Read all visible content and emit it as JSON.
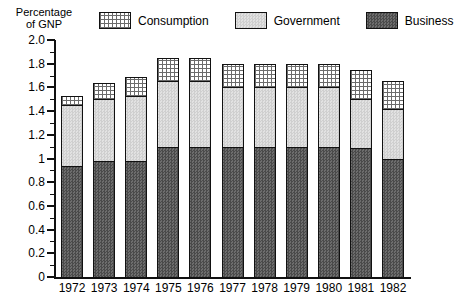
{
  "axis_title": "Percentage\nof GNP",
  "legend": [
    {
      "key": "consumption",
      "label": "Consumption",
      "pattern": "dot-grid",
      "color": "#ffffff"
    },
    {
      "key": "government",
      "label": "Government",
      "pattern": "light-checker",
      "color": "#d7d7d7"
    },
    {
      "key": "business",
      "label": "Business",
      "pattern": "dark-checker",
      "color": "#5a5a5a"
    }
  ],
  "y_tick_labels": [
    "2.0",
    "1.8",
    "1.6",
    "1.4",
    "1.2",
    "1",
    "0.8",
    "0.6",
    "0.4",
    "0.2",
    "0"
  ],
  "chart_data": {
    "type": "bar",
    "title": "",
    "subtype": "stacked",
    "xlabel": "",
    "ylabel": "Percentage of GNP",
    "ylim": [
      0,
      2.0
    ],
    "ytick_step": 0.2,
    "yminor_step": 0.1,
    "grid": false,
    "legend_position": "top",
    "categories": [
      "1972",
      "1973",
      "1974",
      "1975",
      "1976",
      "1977",
      "1978",
      "1979",
      "1980",
      "1981",
      "1982"
    ],
    "series": [
      {
        "name": "Business",
        "values": [
          0.94,
          0.98,
          0.98,
          1.1,
          1.1,
          1.1,
          1.1,
          1.1,
          1.1,
          1.09,
          1.0
        ]
      },
      {
        "name": "Government",
        "values": [
          0.51,
          0.52,
          0.55,
          0.55,
          0.55,
          0.5,
          0.5,
          0.5,
          0.5,
          0.41,
          0.42
        ]
      },
      {
        "name": "Consumption",
        "values": [
          0.08,
          0.14,
          0.16,
          0.2,
          0.2,
          0.2,
          0.2,
          0.2,
          0.2,
          0.25,
          0.23
        ]
      }
    ],
    "totals": [
      1.53,
      1.64,
      1.69,
      1.85,
      1.85,
      1.8,
      1.8,
      1.8,
      1.8,
      1.75,
      1.65
    ],
    "cumulative_tops": {
      "business": [
        0.94,
        0.98,
        0.98,
        1.1,
        1.1,
        1.1,
        1.1,
        1.1,
        1.1,
        1.09,
        1.0
      ],
      "government": [
        1.45,
        1.5,
        1.53,
        1.65,
        1.65,
        1.6,
        1.6,
        1.6,
        1.6,
        1.5,
        1.42
      ],
      "consumption": [
        1.53,
        1.64,
        1.69,
        1.85,
        1.85,
        1.8,
        1.8,
        1.8,
        1.8,
        1.75,
        1.65
      ]
    }
  }
}
